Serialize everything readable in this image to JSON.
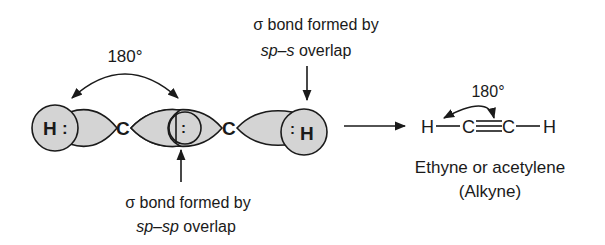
{
  "diagram": {
    "left_angle_label": "180°",
    "top_annotation": {
      "prefix": "σ bond formed by",
      "line2_italic": "sp–s",
      "line2_rest": " overlap"
    },
    "bottom_annotation": {
      "prefix": "σ bond formed by",
      "line2_italic": "sp–sp",
      "line2_rest": " overlap"
    },
    "atoms": {
      "h_left": "H",
      "h_left_dots": ":",
      "c1": "C",
      "center_dots": ":",
      "c2": "C",
      "h_right_dots": ":",
      "h_right": "H"
    },
    "product": {
      "angle_label": "180°",
      "formula": {
        "h1": "H",
        "c1": "C",
        "c2": "C",
        "h2": "H"
      },
      "name": "Ethyne or acetylene",
      "class": "(Alkyne)"
    },
    "colors": {
      "orbital_fill": "#d4d4d4",
      "stroke": "#1a1a1a"
    }
  }
}
